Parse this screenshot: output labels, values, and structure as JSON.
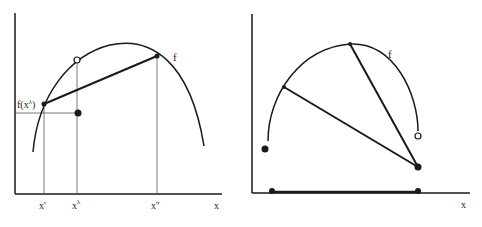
{
  "figure": {
    "colors": {
      "ink": "#1a1a1a",
      "guide": "#555555",
      "background": "#ffffff"
    },
    "left_panel": {
      "function_label": "f",
      "y_label": "f(x",
      "y_label_sup": "λ",
      "y_label_close": ")",
      "x_ticks": [
        {
          "label": "x'",
          "sup": ""
        },
        {
          "label": "x",
          "sup": "λ"
        },
        {
          "label": "x''",
          "sup": ""
        }
      ],
      "x_axis_label": "x",
      "points": {
        "chord_start": "x' on f (filled)",
        "chord_end": "x'' on f (filled)",
        "curve_at_x_lambda": "open circle",
        "value_at_x_lambda": "filled dot"
      }
    },
    "right_panel": {
      "function_label": "f",
      "x_axis_label": "x",
      "points": {
        "left_endpoint": "filled",
        "right_endpoint_curve": "open circle",
        "right_endpoint_value": "filled",
        "domain_endpoints": "filled dots on x-axis"
      }
    }
  }
}
